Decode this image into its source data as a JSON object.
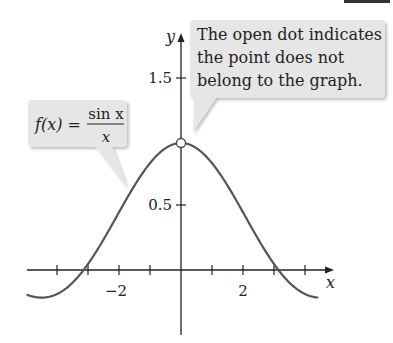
{
  "chart_data": {
    "type": "line",
    "title": "",
    "function": "f(x) = sin x / x",
    "xlabel": "x",
    "ylabel": "y",
    "xlim": [
      -5,
      4.6
    ],
    "ylim": [
      -0.5,
      1.8
    ],
    "x_ticks": [
      -4,
      -3,
      -2,
      -1,
      1,
      2,
      3,
      4
    ],
    "x_tick_labels": [
      {
        "value": -2,
        "label": "−2"
      },
      {
        "value": 2,
        "label": "2"
      }
    ],
    "y_ticks": [
      0.5,
      1.5
    ],
    "y_tick_labels": [
      {
        "value": 0.5,
        "label": "0.5"
      },
      {
        "value": 1.5,
        "label": "1.5"
      }
    ],
    "grid": false,
    "series": [
      {
        "name": "f(x) = sin x / x",
        "domain": [
          -4.95,
          4.4
        ],
        "x": [
          -4.95,
          -4.5,
          -4.0,
          -3.5,
          -3.14,
          -3.0,
          -2.5,
          -2.0,
          -1.5,
          -1.0,
          -0.5,
          0,
          0.5,
          1.0,
          1.5,
          2.0,
          2.5,
          3.0,
          3.14,
          3.5,
          4.0,
          4.4
        ],
        "y": [
          -0.197,
          -0.217,
          -0.189,
          -0.1,
          0.0,
          0.047,
          0.239,
          0.455,
          0.665,
          0.841,
          0.959,
          1.0,
          0.959,
          0.841,
          0.665,
          0.455,
          0.239,
          0.047,
          0.0,
          -0.1,
          -0.189,
          -0.216
        ],
        "color": "#555555"
      }
    ],
    "annotations": [
      {
        "type": "open-dot",
        "x": 0,
        "y": 1,
        "meaning": "point not on graph"
      },
      {
        "type": "callout",
        "text": "The open dot indicates the point does not belong to the graph.",
        "points_to": [
          0,
          1
        ]
      },
      {
        "type": "callout",
        "text": "f(x) = sin x / x",
        "points_to": "curve"
      }
    ]
  },
  "callouts": {
    "note": {
      "lines": [
        "The open dot indicates",
        "the point does not",
        "belong to the graph."
      ]
    },
    "formula": {
      "lhs": "f(x) =",
      "numerator": "sin x",
      "denominator": "x"
    }
  },
  "axes": {
    "x_label": "x",
    "y_label": "y",
    "tick_minus2": "−2",
    "tick_2": "2",
    "tick_05": "0.5",
    "tick_15": "1.5"
  },
  "colors": {
    "curve": "#555555",
    "axis": "#222222",
    "callout_fill": "#e6e6e6",
    "callout_shadow": "#cfcfcf"
  }
}
